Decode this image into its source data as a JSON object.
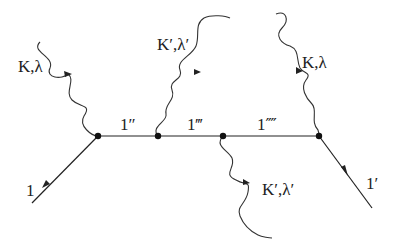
{
  "diagram": {
    "type": "feynman-diagram",
    "labels": {
      "incoming_electron": "1",
      "outgoing_electron": "1′",
      "internal_1": "1″",
      "internal_2": "1‴",
      "internal_3": "1⁗",
      "photon_in_left": "K,λ",
      "photon_out_top": "K′,λ′",
      "photon_in_right": "K,λ",
      "photon_out_bottom": "K′,λ′"
    },
    "colors": {
      "line": "#222222",
      "background": "#ffffff"
    }
  }
}
